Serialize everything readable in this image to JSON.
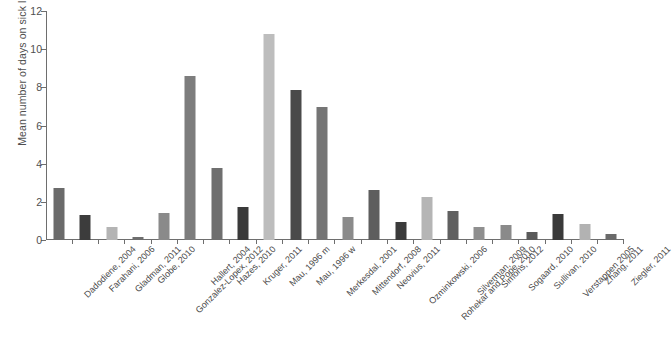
{
  "chart_data": {
    "type": "bar",
    "title": "",
    "xlabel": "",
    "ylabel": "Mean number of days on sick leave per month",
    "ylim": [
      0,
      12
    ],
    "yticks": [
      0,
      2,
      4,
      6,
      8,
      10,
      12
    ],
    "grid": false,
    "legend": "none",
    "categories": [
      "Dadodiene, 2004",
      "Farahani, 2006",
      "Gladman, 2011",
      "Globe, 2010",
      "Gonzalez-Lopex, 2012",
      "Hallert, 2004",
      "Hazes, 2010",
      "Kruger, 2011",
      "Mau, 1996 m",
      "Mau, 1996 w",
      "Merkesdal, 2001",
      "Mittendorf, 2008",
      "Neovius, 2011",
      "Ozminkowski, 2006",
      "Rohekar and Pope, 2010",
      "Silverman, 2009",
      "Simons, 2012",
      "Sogaard, 2010",
      "Sullivan, 2010",
      "Verstappen 2005",
      "Zhang, 2011",
      "Ziegler, 2011"
    ],
    "values": [
      2.7,
      1.3,
      0.7,
      0.15,
      1.4,
      8.6,
      3.75,
      1.75,
      10.8,
      7.85,
      6.95,
      1.2,
      2.6,
      0.95,
      2.25,
      1.5,
      0.7,
      0.8,
      0.4,
      1.35,
      0.85,
      0.3
    ],
    "bar_colors": [
      "#6b6b6b",
      "#3c3c3c",
      "#b4b4b4",
      "#6e6e6e",
      "#8a8a8a",
      "#7d7d7d",
      "#6f6f6f",
      "#3a3a3a",
      "#bdbdbd",
      "#4a4a4a",
      "#757575",
      "#8b8b8b",
      "#5e5e5e",
      "#3b3b3b",
      "#b5b5b5",
      "#606060",
      "#8f8f8f",
      "#8a8a8a",
      "#5a5a5a",
      "#3a3a3a",
      "#b2b2b2",
      "#6a6a6a"
    ]
  },
  "axis": {
    "y_tick_labels": [
      "0",
      "2",
      "4",
      "6",
      "8",
      "10",
      "12"
    ]
  },
  "caption": {
    "text": ""
  }
}
